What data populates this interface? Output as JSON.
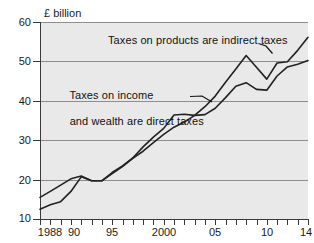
{
  "chart_data": {
    "type": "line",
    "title": "",
    "subtitle": "",
    "unit_label": "£ billion",
    "xlabel": "",
    "ylabel": "£ billion",
    "ylim": [
      10,
      60
    ],
    "xlim": [
      1988,
      2014
    ],
    "ytick_values": [
      10,
      20,
      30,
      40,
      50,
      60
    ],
    "ytick_labels": [
      "10",
      "20",
      "30",
      "40",
      "50",
      "60"
    ],
    "xtick_values": [
      1988,
      1989,
      1990,
      1991,
      1992,
      1993,
      1994,
      1995,
      1996,
      1997,
      1998,
      1999,
      2000,
      2001,
      2002,
      2003,
      2004,
      2005,
      2006,
      2007,
      2008,
      2009,
      2010,
      2011,
      2012,
      2013,
      2014
    ],
    "xtick_labeled": [
      {
        "value": 1988,
        "label": "1988"
      },
      {
        "value": 1990,
        "label": "90"
      },
      {
        "value": 1995,
        "label": "95"
      },
      {
        "value": 2000,
        "label": "2000"
      },
      {
        "value": 2005,
        "label": "05"
      },
      {
        "value": 2010,
        "label": "10"
      },
      {
        "value": 2014,
        "label": "14"
      }
    ],
    "grid": true,
    "grid_axis": "y",
    "legend_position": "annotations-inline",
    "x": [
      1988,
      1989,
      1990,
      1991,
      1992,
      1993,
      1994,
      1995,
      1996,
      1997,
      1998,
      1999,
      2000,
      2001,
      2002,
      2003,
      2004,
      2005,
      2006,
      2007,
      2008,
      2009,
      2010,
      2011,
      2012,
      2013,
      2014
    ],
    "series": [
      {
        "name": "Taxes on products are indirect taxes",
        "color": "#222222",
        "values": [
          15.5,
          17.0,
          18.6,
          20.2,
          20.9,
          19.7,
          19.7,
          21.5,
          23.3,
          25.4,
          27.2,
          29.4,
          31.5,
          33.3,
          34.6,
          36.3,
          36.5,
          38.1,
          40.8,
          43.7,
          44.6,
          42.9,
          42.7,
          46.3,
          48.6,
          49.3,
          50.2
        ],
        "annotation": "Taxes on products are indirect taxes"
      },
      {
        "name": "Taxes on income and wealth are direct taxes",
        "color": "#222222",
        "values": [
          12.5,
          13.6,
          14.4,
          17.0,
          20.7,
          19.7,
          19.7,
          21.8,
          23.5,
          25.5,
          28.3,
          30.8,
          33.0,
          36.4,
          36.6,
          36.3,
          38.5,
          41.2,
          44.7,
          48.1,
          51.5,
          48.5,
          45.5,
          49.6,
          49.9,
          52.8,
          56.1
        ],
        "annotation": "Taxes on income\nand wealth are direct taxes"
      }
    ],
    "annotations": [
      {
        "id": "indirect",
        "text": "Taxes on products are indirect taxes",
        "points_to_series": "Taxes on products are indirect taxes"
      },
      {
        "id": "direct",
        "text": "Taxes on income\nand wealth are direct taxes",
        "points_to_series": "Taxes on income and wealth are direct taxes"
      }
    ]
  },
  "annotations": {
    "indirect_line1": "Taxes on products are indirect taxes",
    "direct_line1": "Taxes on income",
    "direct_line2": "and wealth are direct taxes"
  },
  "axes": {
    "unit_label": "£ billion"
  },
  "colors": {
    "plot_background": "#e9e9e9",
    "page_background": "#ffffff",
    "axis": "#3a3a3a",
    "gridline": "#8d8d8d",
    "series": "#222222",
    "text": "#1a1a1a"
  }
}
